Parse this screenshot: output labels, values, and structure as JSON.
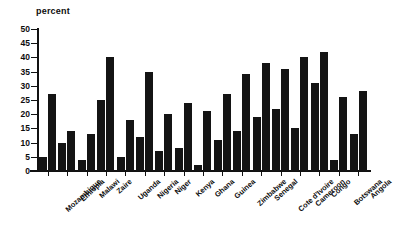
{
  "chart_data": {
    "type": "bar",
    "title": "",
    "subtitle": "",
    "xlabel": "",
    "ylabel": "percent",
    "ylim": [
      0,
      50
    ],
    "yticks": [
      0,
      5,
      10,
      15,
      20,
      25,
      30,
      35,
      40,
      45,
      50
    ],
    "grid": false,
    "legend": "none",
    "bar_color": "#141414",
    "categories": [
      "Mozambique",
      "Ethiopia",
      "Malawi",
      "Zaire",
      "Uganda",
      "Nigeria",
      "Niger",
      "Kenya",
      "Ghana",
      "Guinea",
      "Zimbabwe",
      "Senegal",
      "Cote d'Ivoire",
      "Cameroon",
      "Congo",
      "Botswana",
      "Angola"
    ],
    "series": [
      {
        "name": "series-1",
        "values": [
          5,
          10,
          4,
          25,
          5,
          12,
          7,
          8,
          2,
          11,
          14,
          19,
          22,
          15,
          31,
          4,
          13
        ]
      },
      {
        "name": "series-2",
        "values": [
          27,
          14,
          13,
          40,
          18,
          35,
          20,
          24,
          21,
          27,
          34,
          38,
          36,
          40,
          42,
          26,
          28
        ]
      }
    ]
  }
}
